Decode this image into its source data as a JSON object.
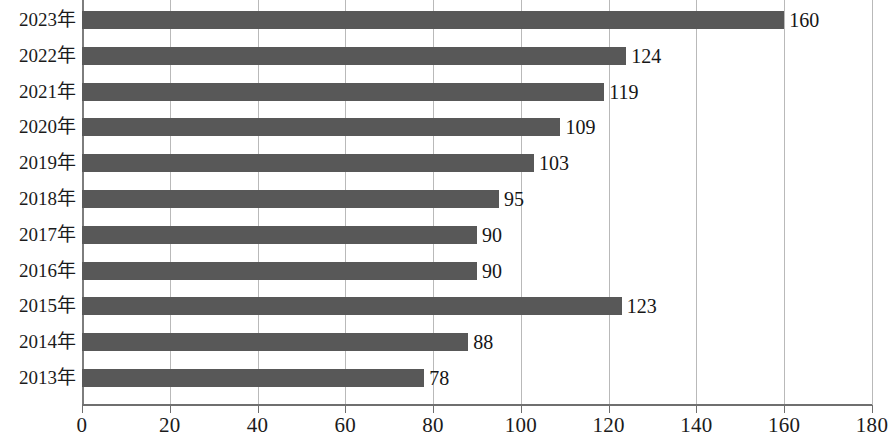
{
  "chart_data": {
    "type": "bar",
    "orientation": "horizontal",
    "title": "",
    "xlabel": "",
    "ylabel": "",
    "categories": [
      "2023年",
      "2022年",
      "2021年",
      "2020年",
      "2019年",
      "2018年",
      "2017年",
      "2016年",
      "2015年",
      "2014年",
      "2013年"
    ],
    "values": [
      160,
      124,
      119,
      109,
      103,
      95,
      90,
      90,
      123,
      88,
      78
    ],
    "data_labels": [
      "160",
      "124",
      "119",
      "109",
      "103",
      "95",
      "90",
      "90",
      "123",
      "88",
      "78"
    ],
    "xlim": [
      0,
      180
    ],
    "xticks": [
      0,
      20,
      40,
      60,
      80,
      100,
      120,
      140,
      160,
      180
    ],
    "xtick_labels": [
      "0",
      "20",
      "40",
      "60",
      "80",
      "100",
      "120",
      "140",
      "160",
      "180"
    ],
    "grid": "vertical",
    "legend": null,
    "bar_color": "#585858",
    "gridline_color": "#b9b9b9",
    "axis_color": "#6f6f6f",
    "text_color": "#1b1b1b"
  }
}
